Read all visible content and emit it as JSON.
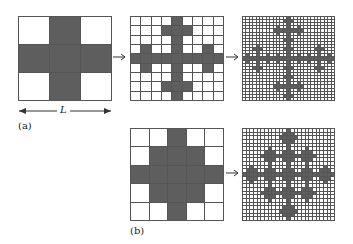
{
  "figure": {
    "panels": [
      {
        "id": "a1",
        "label": "",
        "size": 3,
        "pattern_rule": "cross",
        "generation": 1
      },
      {
        "id": "a2",
        "label": "",
        "size": 9,
        "pattern_rule": "cross",
        "generation": 2
      },
      {
        "id": "a3",
        "label": "",
        "size": 27,
        "pattern_rule": "cross",
        "generation": 3
      },
      {
        "id": "b1",
        "label": "",
        "size": 5,
        "pattern_rule": "diamond",
        "generation": 1
      },
      {
        "id": "b2",
        "label": "",
        "size": 25,
        "pattern_rule": "diamond",
        "generation": 2
      }
    ],
    "labels": {
      "a": "(a)",
      "b": "(b)",
      "length": "L"
    },
    "arrows": [
      {
        "from": "a1",
        "to": "a2"
      },
      {
        "from": "a2",
        "to": "a3"
      },
      {
        "from": "b1",
        "to": "b2"
      }
    ],
    "colors": {
      "filled": "#5e5e5e",
      "empty": "#ffffff",
      "line": "#555555"
    }
  }
}
